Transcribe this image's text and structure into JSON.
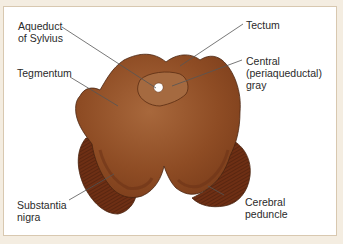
{
  "figure": {
    "labels": {
      "aqueduct": "Aqueduct\nof Sylvius",
      "tectum": "Tectum",
      "tegmentum": "Tegmentum",
      "central_gray": "Central\n(periaqueductal)\ngray",
      "substantia_nigra": "Substantia\nnigra",
      "cerebral_peduncle": "Cerebral\npeduncle"
    },
    "colors": {
      "frame_bg": "#f4ede1",
      "panel_bg": "#ffffff",
      "tissue_main": "#8b4a22",
      "tissue_light": "#a5653a",
      "peduncle": "#6e2f14",
      "outline": "#4a2410",
      "leader_line": "#555555"
    }
  }
}
